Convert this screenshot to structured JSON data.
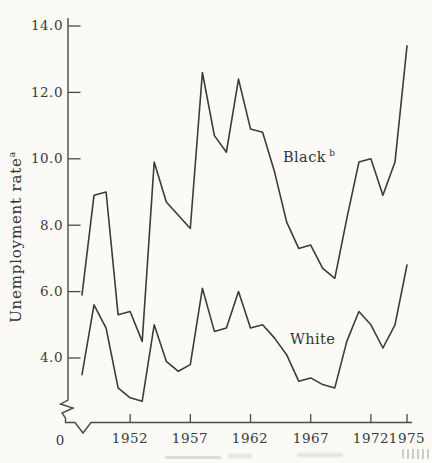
{
  "figure": {
    "paper_color": "#fbfaf7",
    "ink_color": "#3c3c3c",
    "y_axis": {
      "title": "Unemployment rate",
      "title_superscript": "a",
      "tick_values": [
        14.0,
        12.0,
        10.0,
        8.0,
        6.0,
        4.0
      ],
      "tick_labels": [
        "14.0",
        "12.0",
        "10.0",
        "8.0",
        "6.0",
        "4.0"
      ],
      "origin_label": "0",
      "has_break": true
    },
    "x_axis": {
      "tick_years": [
        1952,
        1957,
        1962,
        1967,
        1972,
        1975
      ],
      "tick_labels": [
        "1952",
        "1957",
        "1962",
        "1967",
        "1972",
        "1975"
      ],
      "has_break": true
    },
    "series_labels": {
      "black": {
        "text": "Black",
        "superscript": "b"
      },
      "white": {
        "text": "White"
      }
    }
  },
  "chart_data": {
    "type": "line",
    "title": "",
    "xlabel": "",
    "ylabel": "Unemployment rate (a)",
    "x": [
      1948,
      1949,
      1950,
      1951,
      1952,
      1953,
      1954,
      1955,
      1956,
      1957,
      1958,
      1959,
      1960,
      1961,
      1962,
      1963,
      1964,
      1965,
      1966,
      1967,
      1968,
      1969,
      1970,
      1971,
      1972,
      1973,
      1974,
      1975
    ],
    "series": [
      {
        "name": "Black (b)",
        "values": [
          5.9,
          8.9,
          9.0,
          5.3,
          5.4,
          4.5,
          9.9,
          8.7,
          8.3,
          7.9,
          12.6,
          10.7,
          10.2,
          12.4,
          10.9,
          10.8,
          9.6,
          8.1,
          7.3,
          7.4,
          6.7,
          6.4,
          8.2,
          9.9,
          10.0,
          8.9,
          9.9,
          13.4
        ]
      },
      {
        "name": "White",
        "values": [
          3.5,
          5.6,
          4.9,
          3.1,
          2.8,
          2.7,
          5.0,
          3.9,
          3.6,
          3.8,
          6.1,
          4.8,
          4.9,
          6.0,
          4.9,
          5.0,
          4.6,
          4.1,
          3.3,
          3.4,
          3.2,
          3.1,
          4.5,
          5.4,
          5.0,
          4.3,
          5.0,
          6.8
        ]
      }
    ],
    "xlim": [
      1948,
      1975
    ],
    "ylim": [
      0,
      14
    ],
    "y_axis_break_between": [
      0,
      2.6
    ],
    "grid": false,
    "legend_position": "inline-annotations"
  }
}
